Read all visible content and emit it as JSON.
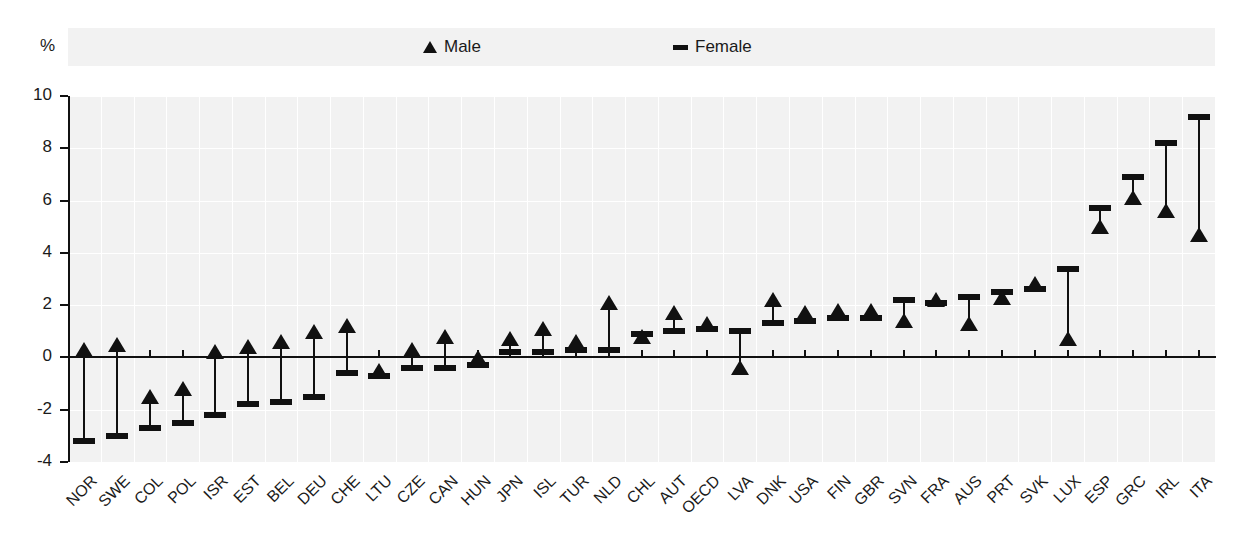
{
  "axis": {
    "unit_label": "%",
    "y_ticks": [
      "10",
      "8",
      "6",
      "4",
      "2",
      "0",
      "-2",
      "-4"
    ]
  },
  "legend": {
    "male": {
      "label": "Male",
      "marker": "triangle-up-marker"
    },
    "female": {
      "label": "Female",
      "marker": "dash-marker"
    }
  },
  "chart_data": {
    "type": "scatter",
    "title": "",
    "subtitle": "",
    "xlabel": "",
    "ylabel": "%",
    "ylim": [
      -4,
      10
    ],
    "y_ticks": [
      10,
      8,
      6,
      4,
      2,
      0,
      -2,
      -4
    ],
    "grid": true,
    "legend_position": "top",
    "categories": [
      "NOR",
      "SWE",
      "COL",
      "POL",
      "ISR",
      "EST",
      "BEL",
      "DEU",
      "CHE",
      "LTU",
      "CZE",
      "CAN",
      "HUN",
      "JPN",
      "ISL",
      "TUR",
      "NLD",
      "CHL",
      "AUT",
      "OECD",
      "LVA",
      "DNK",
      "USA",
      "FIN",
      "GBR",
      "SVN",
      "FRA",
      "AUS",
      "PRT",
      "SVK",
      "LUX",
      "ESP",
      "GRC",
      "IRL",
      "ITA"
    ],
    "series": [
      {
        "name": "Male",
        "marker": "triangle",
        "values": [
          0.1,
          0.3,
          -1.7,
          -1.4,
          0.0,
          0.2,
          0.4,
          0.8,
          1.0,
          -0.7,
          0.1,
          0.6,
          -0.2,
          0.5,
          0.9,
          0.4,
          1.9,
          0.6,
          1.5,
          1.1,
          -0.6,
          2.0,
          1.5,
          1.6,
          1.6,
          1.2,
          2.0,
          1.1,
          2.1,
          2.6,
          0.5,
          4.8,
          5.9,
          5.4,
          4.5
        ]
      },
      {
        "name": "Female",
        "marker": "dash",
        "values": [
          -3.2,
          -3.0,
          -2.7,
          -2.5,
          -2.2,
          -1.8,
          -1.7,
          -1.5,
          -0.6,
          -0.7,
          -0.4,
          -0.4,
          -0.3,
          0.2,
          0.2,
          0.3,
          0.3,
          0.9,
          1.0,
          1.1,
          1.0,
          1.3,
          1.4,
          1.5,
          1.5,
          2.2,
          2.1,
          2.3,
          2.5,
          2.6,
          3.4,
          5.7,
          6.9,
          8.2,
          9.2
        ]
      }
    ]
  }
}
